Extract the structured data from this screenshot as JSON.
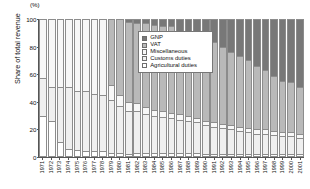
{
  "chart_data": {
    "type": "bar",
    "stacked": true,
    "title": "",
    "xlabel": "",
    "ylabel": "Share of total revenue",
    "unit_label": "(%)",
    "ylim": [
      0,
      100
    ],
    "yticks": [
      0,
      20,
      40,
      60,
      80,
      100
    ],
    "grid": false,
    "legend_position": "top-center",
    "stack_order_bottom_to_top": [
      "Agricultural duties",
      "Customs duties",
      "Miscellaneous",
      "VAT",
      "GNP"
    ],
    "categories": [
      "1971",
      "1972",
      "1973",
      "1974",
      "1975",
      "1976",
      "1977",
      "1978",
      "1979",
      "1980",
      "1981",
      "1982",
      "1983",
      "1984",
      "1985",
      "1986",
      "1987",
      "1988",
      "1989",
      "1990",
      "1991",
      "1992",
      "1993",
      "1994",
      "1995",
      "1996",
      "1997",
      "1998",
      "1999",
      "2000",
      "2001"
    ],
    "series": [
      {
        "name": "Agricultural duties",
        "color": "#ffffff",
        "values": [
          30,
          26,
          11,
          6,
          5,
          4,
          4,
          4,
          3,
          3,
          2,
          3,
          3,
          3,
          3,
          3,
          3,
          3,
          3,
          2,
          2,
          2,
          2,
          2,
          2,
          2,
          2,
          2,
          2,
          2,
          2
        ]
      },
      {
        "name": "Customs duties",
        "color": "#efefef",
        "values": [
          27,
          25,
          40,
          45,
          43,
          44,
          42,
          41,
          38,
          34,
          31,
          30,
          28,
          27,
          26,
          25,
          24,
          23,
          22,
          21,
          20,
          19,
          18,
          17,
          16,
          15,
          15,
          14,
          13,
          13,
          12
        ]
      },
      {
        "name": "Miscellaneous",
        "color": "#f7f7f7",
        "values": [
          43,
          49,
          49,
          49,
          52,
          52,
          54,
          55,
          11,
          8,
          7,
          6,
          5,
          4,
          4,
          4,
          4,
          4,
          3,
          3,
          3,
          3,
          3,
          3,
          3,
          3,
          3,
          3,
          3,
          3,
          3
        ]
      },
      {
        "name": "VAT",
        "color": "#b9b9b9",
        "values": [
          0,
          0,
          0,
          0,
          0,
          0,
          0,
          0,
          48,
          55,
          58,
          58,
          61,
          62,
          62,
          63,
          56,
          58,
          58,
          60,
          58,
          56,
          53,
          51,
          49,
          46,
          43,
          40,
          37,
          36,
          34
        ]
      },
      {
        "name": "GNP",
        "color": "#787878",
        "values": [
          0,
          0,
          0,
          0,
          0,
          0,
          0,
          0,
          0,
          0,
          2,
          3,
          3,
          4,
          5,
          5,
          13,
          12,
          14,
          14,
          17,
          20,
          24,
          27,
          30,
          34,
          37,
          41,
          45,
          46,
          49
        ]
      }
    ],
    "legend_entries": [
      {
        "label": "GNP",
        "color": "#787878"
      },
      {
        "label": "VAT",
        "color": "#b9b9b9"
      },
      {
        "label": "Miscellaneous",
        "color": "#f7f7f7"
      },
      {
        "label": "Customs duties",
        "color": "#efefef"
      },
      {
        "label": "Agricultural duties",
        "color": "#ffffff"
      }
    ]
  }
}
